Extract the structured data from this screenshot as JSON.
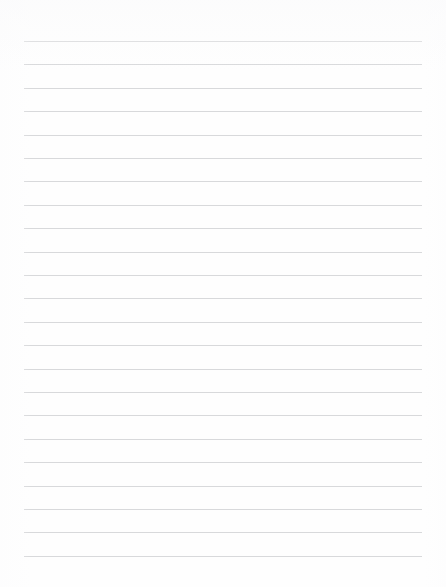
{
  "document": {
    "type": "lined-paper",
    "title": "",
    "body_text": "",
    "page_number": "",
    "header_text": "",
    "footer_text": ""
  },
  "page": {
    "width": 446,
    "height": 587,
    "background_color": "#ffffff",
    "paper_color": "#fefefe"
  },
  "rules": {
    "count": 23,
    "color": "#d8d9db",
    "thickness_px": 1,
    "left_x": 24,
    "right_x": 422,
    "first_y": 41,
    "spacing_px": 23.4,
    "y_positions": [
      41,
      64.4,
      87.8,
      111.2,
      134.6,
      158,
      181.4,
      204.8,
      228.2,
      251.6,
      275,
      298.4,
      321.8,
      345.2,
      368.6,
      392,
      415.4,
      438.8,
      462.2,
      485.6,
      509,
      532.4,
      555.8
    ]
  },
  "margin_line": {
    "visible": false,
    "color": "",
    "x": 0
  }
}
